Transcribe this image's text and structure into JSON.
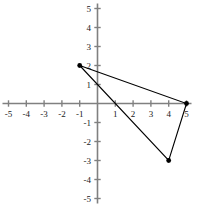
{
  "chart_data": {
    "type": "scatter",
    "title": "",
    "xlabel": "",
    "ylabel": "",
    "xlim": [
      -5,
      5
    ],
    "ylim": [
      -5,
      5
    ],
    "grid": false,
    "legend": null,
    "x_ticks": [
      -5,
      -4,
      -3,
      -2,
      -1,
      1,
      2,
      3,
      4,
      5
    ],
    "y_ticks": [
      5,
      4,
      3,
      2,
      1,
      -1,
      -2,
      -3,
      -4,
      -5
    ],
    "x_tick_labels": [
      "-5",
      "-4",
      "-3",
      "-2",
      "-1",
      "1",
      "2",
      "3",
      "4",
      "5"
    ],
    "y_tick_labels": [
      "5",
      "4",
      "3",
      "2",
      "1",
      "-1",
      "-2",
      "-3",
      "-4",
      "-5"
    ],
    "series": [
      {
        "name": "triangle",
        "closed": true,
        "marker": "filled-circle",
        "color": "#000000",
        "points": [
          {
            "x": -1,
            "y": 2,
            "label": "(-1, 2)"
          },
          {
            "x": 5,
            "y": 0,
            "label": "(5, 0)"
          },
          {
            "x": 4,
            "y": -3,
            "label": "(4, -3)"
          }
        ]
      }
    ],
    "axis_color": "#808080",
    "line_color": "#000000",
    "marker_color": "#000000",
    "background_color": "#ffffff"
  },
  "axes": {
    "x_axis_name": "horizontal-axis",
    "y_axis_name": "vertical-axis"
  }
}
